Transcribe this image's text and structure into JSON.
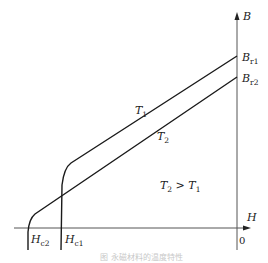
{
  "diagram": {
    "type": "demagnetization-curves",
    "axes": {
      "y_label": "B",
      "x_label": "H",
      "origin_label": "0"
    },
    "curves": [
      {
        "name": "T1",
        "label": "T",
        "label_sub": "1",
        "br_label": "B",
        "br_sub": "r1",
        "hc_label": "H",
        "hc_sub": "c1"
      },
      {
        "name": "T2",
        "label": "T",
        "label_sub": "2",
        "br_label": "B",
        "br_sub": "r2",
        "hc_label": "H",
        "hc_sub": "c2"
      }
    ],
    "annotation": {
      "left": "T",
      "left_sub": "2",
      "op": " > ",
      "right": "T",
      "right_sub": "1"
    },
    "caption": "图 永磁材料的温度特性",
    "colors": {
      "line": "#1a1a1a",
      "axis": "#555555",
      "caption": "#c8c8c8"
    }
  }
}
